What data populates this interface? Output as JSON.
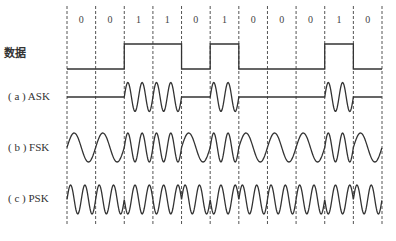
{
  "labels": {
    "data": "数据",
    "ask": "( a ) ASK",
    "fsk": "( b ) FSK",
    "psk": "( c ) PSK"
  },
  "bits": [
    "0",
    "0",
    "1",
    "1",
    "0",
    "1",
    "0",
    "0",
    "0",
    "1",
    "0"
  ],
  "colors": {
    "line": "#333333",
    "dash": "#555555",
    "background": "#ffffff"
  }
}
